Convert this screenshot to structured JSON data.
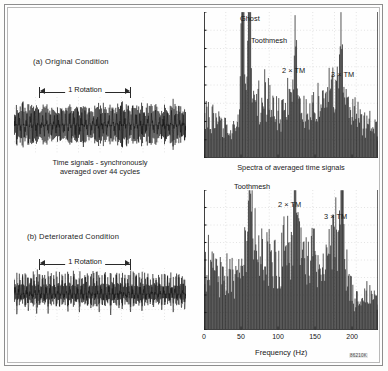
{
  "figure": {
    "reference_code": "86210K"
  },
  "panels": [
    {
      "id": "a",
      "condition_label": "(a) Original Condition",
      "rotation_label": "1 Rotation",
      "caption_line1": "Time signals - synchronously",
      "caption_line2": "averaged over 44 cycles"
    },
    {
      "id": "b",
      "condition_label": "(b) Deteriorated Condition",
      "rotation_label": "1 Rotation",
      "caption_line1": "",
      "caption_line2": ""
    }
  ],
  "spectra": {
    "caption": "Spectra of averaged time signals",
    "xaxis_title": "Frequency (Hz)",
    "xticks": [
      "0",
      "50",
      "100",
      "150",
      "200"
    ],
    "top_peak_labels": [
      "Ghost",
      "Toothmesh",
      "2 × TM",
      "3 × TM"
    ],
    "bottom_peak_labels": [
      "Toothmesh",
      "2 × TM",
      "3 × TM"
    ]
  },
  "chart_data": [
    {
      "type": "line",
      "title": "(a) Original Condition - synchronously averaged time signal",
      "xlabel": "",
      "ylabel": "",
      "grid": true,
      "annotations": [
        "1 Rotation"
      ],
      "x": [
        0,
        1,
        2,
        3,
        4,
        5,
        6,
        7,
        8,
        9,
        10,
        11,
        12,
        13,
        14,
        15,
        16,
        17,
        18,
        19,
        20,
        21,
        22,
        23,
        24,
        25,
        26,
        27,
        28,
        29,
        30,
        31,
        32,
        33,
        34,
        35,
        36,
        37,
        38,
        39,
        40,
        41,
        42,
        43,
        44,
        45,
        46,
        47,
        48,
        49,
        50,
        51,
        52,
        53,
        54,
        55,
        56,
        57,
        58,
        59,
        60,
        61,
        62,
        63,
        64,
        65,
        66,
        67,
        68,
        69,
        70,
        71,
        72,
        73,
        74,
        75,
        76,
        77,
        78,
        79,
        80,
        81,
        82,
        83,
        84,
        85,
        86,
        87,
        88,
        89,
        90,
        91,
        92,
        93,
        94,
        95,
        96,
        97,
        98,
        99,
        100,
        101,
        102,
        103,
        104,
        105,
        106,
        107,
        108,
        109,
        110,
        111,
        112,
        113,
        114,
        115,
        116,
        117,
        118,
        119
      ],
      "values": [
        0.52,
        -0.44,
        0.78,
        -0.62,
        0.7,
        -0.55,
        0.86,
        -0.72,
        0.62,
        -0.5,
        0.74,
        -0.66,
        0.9,
        -0.8,
        0.68,
        -0.58,
        0.82,
        -0.7,
        0.6,
        -0.48,
        0.76,
        -0.64,
        0.88,
        -0.76,
        0.66,
        -0.54,
        0.8,
        -0.68,
        0.58,
        -0.46,
        0.72,
        -0.6,
        0.84,
        -0.74,
        0.64,
        -0.52,
        0.78,
        -0.66,
        0.92,
        -0.82,
        0.7,
        -0.56,
        0.86,
        -0.72,
        0.62,
        -0.5,
        0.74,
        -0.64,
        0.88,
        -0.78,
        0.66,
        -0.54,
        0.8,
        -0.68,
        0.58,
        -0.48,
        0.76,
        -0.62,
        0.9,
        -0.8,
        0.68,
        -0.56,
        0.82,
        -0.7,
        0.6,
        -0.5,
        0.72,
        -0.64,
        0.86,
        -0.74,
        0.64,
        -0.52,
        0.78,
        -0.66,
        0.94,
        -0.84,
        0.7,
        -0.58,
        0.84,
        -0.72,
        0.62,
        -0.48,
        0.74,
        -0.62,
        0.88,
        -0.76,
        0.66,
        -0.54,
        0.8,
        -0.68,
        0.58,
        -0.46,
        0.76,
        -0.64,
        0.9,
        -0.78,
        0.68,
        -0.56,
        0.82,
        -0.7,
        0.6,
        -0.5,
        0.72,
        -0.62,
        0.86,
        -0.74,
        0.64,
        -0.52,
        0.78,
        -0.66,
        0.92,
        -0.8,
        0.7,
        -0.58,
        0.84,
        -0.72,
        0.62,
        -0.5,
        0.74,
        -0.64
      ]
    },
    {
      "type": "line",
      "title": "Spectra of averaged time signals - original condition",
      "xlabel": "Frequency (Hz)",
      "ylabel": "",
      "xlim": [
        0,
        235
      ],
      "grid": true,
      "annotations": [
        "Ghost",
        "Toothmesh",
        "2 × TM",
        "3 × TM"
      ],
      "marked_frequencies": {
        "Ghost": 52,
        "Toothmesh": 62,
        "2 × TM": 124,
        "3 × TM": 186
      },
      "x": [
        0,
        2,
        4,
        6,
        8,
        10,
        12,
        14,
        16,
        18,
        20,
        22,
        24,
        26,
        28,
        30,
        32,
        34,
        36,
        38,
        40,
        42,
        44,
        46,
        48,
        50,
        52,
        54,
        56,
        58,
        60,
        62,
        64,
        66,
        68,
        70,
        72,
        74,
        76,
        78,
        80,
        82,
        84,
        86,
        88,
        90,
        92,
        94,
        96,
        98,
        100,
        102,
        104,
        106,
        108,
        110,
        112,
        114,
        116,
        118,
        120,
        122,
        124,
        126,
        128,
        130,
        132,
        134,
        136,
        138,
        140,
        142,
        144,
        146,
        148,
        150,
        152,
        154,
        156,
        158,
        160,
        162,
        164,
        166,
        168,
        170,
        172,
        174,
        176,
        178,
        180,
        182,
        184,
        186,
        188,
        190,
        192,
        194,
        196,
        198,
        200,
        202,
        204,
        206,
        208,
        210,
        212,
        214,
        216,
        218,
        220,
        222,
        224,
        226,
        228,
        230,
        232,
        234
      ],
      "values": [
        0.3,
        0.34,
        0.28,
        0.38,
        0.32,
        0.26,
        0.3,
        0.24,
        0.28,
        0.22,
        0.26,
        0.2,
        0.24,
        0.18,
        0.22,
        0.26,
        0.2,
        0.24,
        0.18,
        0.22,
        0.26,
        0.3,
        0.24,
        0.28,
        0.34,
        0.42,
        0.96,
        0.56,
        0.34,
        0.4,
        0.52,
        0.8,
        0.46,
        0.34,
        0.4,
        0.46,
        0.36,
        0.42,
        0.34,
        0.4,
        0.46,
        0.52,
        0.44,
        0.5,
        0.42,
        0.48,
        0.4,
        0.36,
        0.42,
        0.34,
        0.3,
        0.36,
        0.28,
        0.34,
        0.3,
        0.36,
        0.42,
        0.48,
        0.4,
        0.46,
        0.38,
        0.44,
        0.64,
        0.4,
        0.34,
        0.4,
        0.32,
        0.38,
        0.3,
        0.36,
        0.42,
        0.34,
        0.4,
        0.46,
        0.38,
        0.44,
        0.36,
        0.42,
        0.34,
        0.3,
        0.36,
        0.42,
        0.48,
        0.4,
        0.46,
        0.52,
        0.44,
        0.5,
        0.42,
        0.48,
        0.54,
        0.46,
        0.52,
        0.66,
        0.44,
        0.38,
        0.44,
        0.36,
        0.42,
        0.34,
        0.4,
        0.32,
        0.38,
        0.3,
        0.36,
        0.28,
        0.34,
        0.26,
        0.32,
        0.24,
        0.3,
        0.22,
        0.28,
        0.2,
        0.26,
        0.18,
        0.24,
        0.16
      ]
    },
    {
      "type": "line",
      "title": "(b) Deteriorated Condition - synchronously averaged time signal",
      "xlabel": "",
      "ylabel": "",
      "grid": true,
      "annotations": [
        "1 Rotation"
      ],
      "x": [
        0,
        1,
        2,
        3,
        4,
        5,
        6,
        7,
        8,
        9,
        10,
        11,
        12,
        13,
        14,
        15,
        16,
        17,
        18,
        19,
        20,
        21,
        22,
        23,
        24,
        25,
        26,
        27,
        28,
        29,
        30,
        31,
        32,
        33,
        34,
        35,
        36,
        37,
        38,
        39,
        40,
        41,
        42,
        43,
        44,
        45,
        46,
        47,
        48,
        49,
        50,
        51,
        52,
        53,
        54,
        55,
        56,
        57,
        58,
        59,
        60,
        61,
        62,
        63,
        64,
        65,
        66,
        67,
        68,
        69,
        70,
        71,
        72,
        73,
        74,
        75,
        76,
        77,
        78,
        79,
        80,
        81,
        82,
        83,
        84,
        85,
        86,
        87,
        88,
        89,
        90,
        91,
        92,
        93,
        94,
        95,
        96,
        97,
        98,
        99,
        100,
        101,
        102,
        103,
        104,
        105,
        106,
        107,
        108,
        109,
        110,
        111,
        112,
        113,
        114,
        115,
        116,
        117,
        118,
        119
      ],
      "values": [
        0.88,
        -0.4,
        0.92,
        -0.44,
        0.86,
        -0.38,
        0.94,
        -0.46,
        0.9,
        -0.42,
        0.96,
        -0.48,
        0.88,
        -0.4,
        0.92,
        -0.44,
        0.98,
        -0.5,
        0.9,
        -0.42,
        0.94,
        -0.46,
        0.86,
        -0.38,
        0.96,
        -0.48,
        0.9,
        -0.42,
        0.92,
        -0.44,
        0.98,
        -0.5,
        0.88,
        -0.4,
        0.94,
        -0.46,
        0.9,
        -0.42,
        1.0,
        -0.52,
        0.92,
        -0.44,
        0.96,
        -0.48,
        0.88,
        -0.4,
        0.94,
        -0.46,
        0.9,
        -0.42,
        0.98,
        -0.5,
        0.92,
        -0.44,
        0.86,
        -0.38,
        0.96,
        -0.48,
        0.9,
        -0.42,
        0.94,
        -0.46,
        1.0,
        -0.52,
        0.88,
        -0.4,
        0.92,
        -0.44,
        0.96,
        -0.48,
        0.9,
        -0.42,
        0.94,
        -0.46,
        0.98,
        -0.5,
        0.88,
        -0.4,
        0.92,
        -0.44,
        0.86,
        -0.38,
        0.96,
        -0.48,
        0.9,
        -0.42,
        0.94,
        -0.46,
        1.0,
        -0.52,
        0.92,
        -0.44,
        0.88,
        -0.4,
        0.96,
        -0.48,
        0.9,
        -0.42,
        0.94,
        -0.46,
        0.98,
        -0.5,
        0.88,
        -0.4,
        0.92,
        -0.44,
        0.86,
        -0.38,
        0.94,
        -0.46,
        0.9,
        -0.42,
        0.96,
        -0.48,
        0.88,
        -0.4,
        0.92,
        -0.44,
        0.98,
        -0.5,
        0.9,
        -0.42
      ]
    },
    {
      "type": "line",
      "title": "Spectra of averaged time signals - deteriorated condition",
      "xlabel": "Frequency (Hz)",
      "ylabel": "",
      "xlim": [
        0,
        235
      ],
      "grid": true,
      "annotations": [
        "Toothmesh",
        "2 × TM",
        "3 × TM"
      ],
      "marked_frequencies": {
        "Toothmesh": 62,
        "2 × TM": 124,
        "3 × TM": 186
      },
      "x": [
        0,
        2,
        4,
        6,
        8,
        10,
        12,
        14,
        16,
        18,
        20,
        22,
        24,
        26,
        28,
        30,
        32,
        34,
        36,
        38,
        40,
        42,
        44,
        46,
        48,
        50,
        52,
        54,
        56,
        58,
        60,
        62,
        64,
        66,
        68,
        70,
        72,
        74,
        76,
        78,
        80,
        82,
        84,
        86,
        88,
        90,
        92,
        94,
        96,
        98,
        100,
        102,
        104,
        106,
        108,
        110,
        112,
        114,
        116,
        118,
        120,
        122,
        124,
        126,
        128,
        130,
        132,
        134,
        136,
        138,
        140,
        142,
        144,
        146,
        148,
        150,
        152,
        154,
        156,
        158,
        160,
        162,
        164,
        166,
        168,
        170,
        172,
        174,
        176,
        178,
        180,
        182,
        184,
        186,
        188,
        190,
        192,
        194,
        196,
        198,
        200,
        202,
        204,
        206,
        208,
        210,
        212,
        214,
        216,
        218,
        220,
        222,
        224,
        226,
        228,
        230,
        232,
        234
      ],
      "values": [
        0.44,
        0.5,
        0.42,
        0.54,
        0.46,
        0.4,
        0.48,
        0.42,
        0.52,
        0.44,
        0.38,
        0.46,
        0.4,
        0.5,
        0.42,
        0.48,
        0.4,
        0.46,
        0.38,
        0.44,
        0.36,
        0.42,
        0.34,
        0.4,
        0.46,
        0.52,
        0.48,
        0.56,
        0.62,
        0.7,
        0.84,
        0.98,
        0.76,
        0.64,
        0.58,
        0.66,
        0.54,
        0.6,
        0.52,
        0.58,
        0.64,
        0.56,
        0.62,
        0.54,
        0.6,
        0.52,
        0.58,
        0.5,
        0.56,
        0.48,
        0.54,
        0.46,
        0.52,
        0.58,
        0.64,
        0.56,
        0.62,
        0.68,
        0.6,
        0.66,
        0.72,
        0.8,
        0.9,
        0.72,
        0.62,
        0.56,
        0.64,
        0.58,
        0.52,
        0.6,
        0.54,
        0.62,
        0.56,
        0.64,
        0.58,
        0.66,
        0.58,
        0.52,
        0.46,
        0.52,
        0.44,
        0.5,
        0.56,
        0.48,
        0.54,
        0.6,
        0.66,
        0.58,
        0.64,
        0.7,
        0.62,
        0.68,
        0.74,
        0.86,
        0.66,
        0.56,
        0.5,
        0.44,
        0.38,
        0.32,
        0.28,
        0.24,
        0.22,
        0.26,
        0.2,
        0.24,
        0.18,
        0.22,
        0.26,
        0.2,
        0.28,
        0.22,
        0.3,
        0.24,
        0.2,
        0.26,
        0.22,
        0.18
      ]
    }
  ]
}
